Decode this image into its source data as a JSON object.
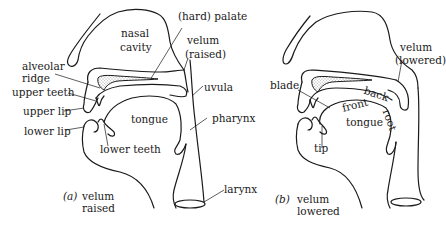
{
  "figure": {
    "type": "vocal tract cross-section diagrams",
    "panels": [
      {
        "id": "a",
        "caption_letter": "(a)",
        "caption_line1": "velum",
        "caption_line2": "raised",
        "labels": {
          "nasal_cavity_1": "nasal",
          "nasal_cavity_2": "cavity",
          "hard_palate": "(hard) palate",
          "velum_1": "velum",
          "velum_2": "(raised)",
          "alveolar_ridge_1": "alveolar",
          "alveolar_ridge_2": "ridge",
          "uvula": "uvula",
          "upper_teeth": "upper teeth",
          "upper_lip": "upper lip",
          "lower_lip": "lower lip",
          "tongue": "tongue",
          "pharynx": "pharynx",
          "lower_teeth": "lower teeth",
          "larynx": "larynx"
        }
      },
      {
        "id": "b",
        "caption_letter": "(b)",
        "caption_line1": "velum",
        "caption_line2": "lowered",
        "labels": {
          "velum_1": "velum",
          "velum_2": "(lowered)",
          "blade": "blade",
          "back": "back",
          "front": "front",
          "root": "root",
          "tongue": "tongue",
          "tip": "tip"
        }
      }
    ],
    "colors": {
      "ink": "#1a1a1a",
      "background": "#ffffff"
    }
  }
}
